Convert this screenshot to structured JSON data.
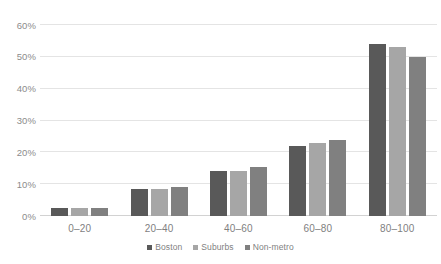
{
  "chart_data": {
    "type": "bar",
    "title": "",
    "subtitle": "",
    "xlabel": "",
    "ylabel": "",
    "categories": [
      "0–20",
      "20–40",
      "40–60",
      "60–80",
      "80–100"
    ],
    "series": [
      {
        "name": "Boston",
        "color": "#595959",
        "values": [
          2.6,
          8.5,
          14.0,
          22.0,
          54.0
        ]
      },
      {
        "name": "Suburbs",
        "color": "#a6a6a6",
        "values": [
          2.4,
          8.4,
          14.0,
          23.0,
          53.0
        ]
      },
      {
        "name": "Non-metro",
        "color": "#808080",
        "values": [
          2.6,
          9.0,
          15.5,
          23.8,
          50.0
        ]
      }
    ],
    "ylim": [
      0,
      60
    ],
    "ytick_values": [
      0,
      10,
      20,
      30,
      40,
      50,
      60
    ],
    "ytick_labels": [
      "0%",
      "10%",
      "20%",
      "30%",
      "40%",
      "50%",
      "60%"
    ],
    "grid": true,
    "legend_position": "bottom",
    "value_format": "percent",
    "gridline_color": "#e4e4e4",
    "axis_color": "#d2d2d2",
    "tick_label_color": "#8c8c8c",
    "background_color": "#ffffff"
  }
}
